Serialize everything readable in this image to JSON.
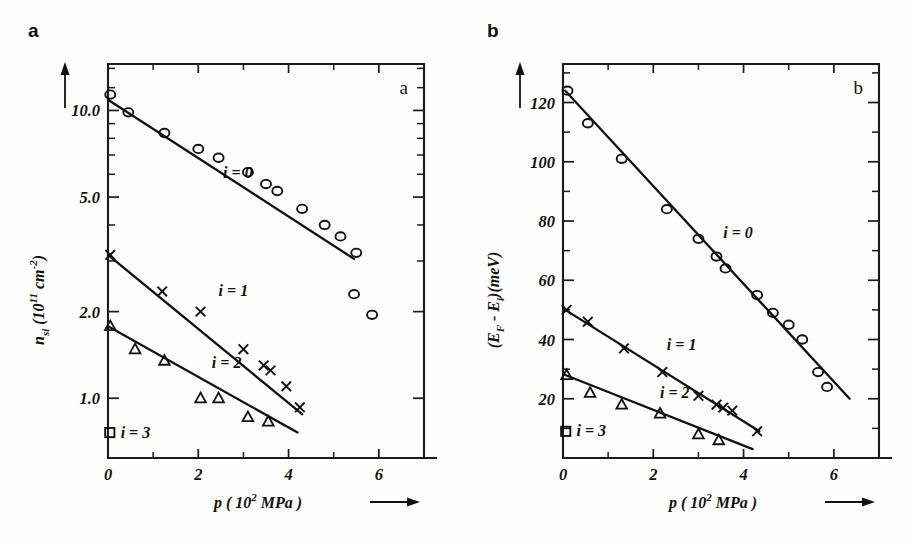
{
  "figure": {
    "panel_a_letter": "a",
    "panel_b_letter": "b"
  },
  "chart_data": [
    {
      "id": "panel-a",
      "type": "scatter",
      "corner_label": "a",
      "title": "",
      "xlabel": "p (10^2 MPa)",
      "xlabel_parts": {
        "symbol": "p",
        "open": "(",
        "base": "10",
        "exp": "2",
        "unit": "MPa",
        "close": ")"
      },
      "ylabel": "n_si (10^11 cm^-2)",
      "ylabel_parts": {
        "symbol": "n",
        "sub": "si",
        "open": "(",
        "base": "10",
        "exp": "11",
        "unit": "cm",
        "unitexp": "-2",
        "close": ")"
      },
      "xscale": "linear",
      "yscale": "log",
      "xlim": [
        0,
        7
      ],
      "ylim": [
        0.62,
        14.5
      ],
      "xticks": [
        0,
        2,
        4,
        6
      ],
      "xticklabels": [
        "0",
        "2",
        "4",
        "6"
      ],
      "xminorticks": [
        1,
        3,
        5,
        7
      ],
      "yticks": [
        1.0,
        2.0,
        5.0,
        10.0
      ],
      "yticklabels": [
        "1.0",
        "2.0",
        "5.0",
        "10.0"
      ],
      "yminorticks": [
        3.0,
        4.0,
        6.0,
        7.0,
        8.0,
        9.0,
        12.0,
        14.0
      ],
      "grid": false,
      "legend_position": "inline-annotations",
      "series": [
        {
          "name": "i = 0",
          "label": "i = 0",
          "marker": "circle",
          "label_x": 2.55,
          "label_y": 6.05,
          "fit": {
            "x": [
              0.0,
              5.45
            ],
            "y": [
              10.9,
              3.05
            ]
          },
          "points": [
            {
              "x": 0.05,
              "y": 11.35
            },
            {
              "x": 0.45,
              "y": 9.85
            },
            {
              "x": 1.25,
              "y": 8.35
            },
            {
              "x": 2.0,
              "y": 7.35
            },
            {
              "x": 2.45,
              "y": 6.85
            },
            {
              "x": 3.1,
              "y": 6.1
            },
            {
              "x": 3.5,
              "y": 5.55
            },
            {
              "x": 3.75,
              "y": 5.25
            },
            {
              "x": 4.3,
              "y": 4.55
            },
            {
              "x": 4.8,
              "y": 4.0
            },
            {
              "x": 5.15,
              "y": 3.65
            },
            {
              "x": 5.5,
              "y": 3.2
            },
            {
              "x": 5.45,
              "y": 2.3
            },
            {
              "x": 5.85,
              "y": 1.95
            }
          ]
        },
        {
          "name": "i = 1",
          "label": "i = 1",
          "marker": "cross",
          "label_x": 2.45,
          "label_y": 2.35,
          "fit": {
            "x": [
              0.0,
              4.3
            ],
            "y": [
              3.15,
              0.88
            ]
          },
          "points": [
            {
              "x": 0.05,
              "y": 3.15
            },
            {
              "x": 1.2,
              "y": 2.35
            },
            {
              "x": 2.05,
              "y": 2.0
            },
            {
              "x": 3.0,
              "y": 1.48
            },
            {
              "x": 3.45,
              "y": 1.3
            },
            {
              "x": 3.6,
              "y": 1.25
            },
            {
              "x": 3.95,
              "y": 1.1
            },
            {
              "x": 4.25,
              "y": 0.93
            }
          ]
        },
        {
          "name": "i = 2",
          "label": "i = 2",
          "marker": "triangle",
          "label_x": 2.3,
          "label_y": 1.33,
          "fit": {
            "x": [
              0.0,
              4.2
            ],
            "y": [
              1.78,
              0.76
            ]
          },
          "points": [
            {
              "x": 0.05,
              "y": 1.78
            },
            {
              "x": 0.6,
              "y": 1.48
            },
            {
              "x": 1.25,
              "y": 1.35
            },
            {
              "x": 2.05,
              "y": 1.0
            },
            {
              "x": 2.45,
              "y": 1.0
            },
            {
              "x": 3.1,
              "y": 0.86
            },
            {
              "x": 3.55,
              "y": 0.83
            }
          ]
        },
        {
          "name": "i = 3",
          "label": "i = 3",
          "marker": "square",
          "label_x": 0.28,
          "label_y": 0.755,
          "fit": null,
          "points": [
            {
              "x": 0.04,
              "y": 0.76
            }
          ]
        }
      ]
    },
    {
      "id": "panel-b",
      "type": "scatter",
      "corner_label": "b",
      "title": "",
      "xlabel": "p (10^2 MPa)",
      "xlabel_parts": {
        "symbol": "p",
        "open": "(",
        "base": "10",
        "exp": "2",
        "unit": "MPa",
        "close": ")"
      },
      "ylabel": "(E_F - E_i)(meV)",
      "ylabel_parts": {
        "open": "(",
        "e1": "E",
        "sub1": "F",
        "minus": "-",
        "e2": "E",
        "sub2": "i",
        "close": ")(meV)"
      },
      "xscale": "linear",
      "yscale": "linear",
      "xlim": [
        0,
        7
      ],
      "ylim": [
        0,
        133
      ],
      "xticks": [
        0,
        2,
        4,
        6
      ],
      "xticklabels": [
        "0",
        "2",
        "4",
        "6"
      ],
      "xminorticks": [
        1,
        3,
        5,
        7
      ],
      "yticks": [
        20,
        40,
        60,
        80,
        100,
        120
      ],
      "yticklabels": [
        "20",
        "40",
        "60",
        "80",
        "100",
        "120"
      ],
      "yminorticks": [
        10,
        30,
        50,
        70,
        90,
        110,
        130
      ],
      "grid": false,
      "legend_position": "inline-annotations",
      "series": [
        {
          "name": "i = 0",
          "label": "i = 0",
          "marker": "circle",
          "label_x": 3.55,
          "label_y": 76,
          "fit": {
            "x": [
              0.05,
              6.35
            ],
            "y": [
              124,
              20
            ]
          },
          "points": [
            {
              "x": 0.1,
              "y": 124
            },
            {
              "x": 0.55,
              "y": 113
            },
            {
              "x": 1.3,
              "y": 101
            },
            {
              "x": 2.3,
              "y": 84
            },
            {
              "x": 3.0,
              "y": 74
            },
            {
              "x": 3.4,
              "y": 68
            },
            {
              "x": 3.6,
              "y": 64
            },
            {
              "x": 4.3,
              "y": 55
            },
            {
              "x": 4.65,
              "y": 49
            },
            {
              "x": 5.0,
              "y": 45
            },
            {
              "x": 5.3,
              "y": 40
            },
            {
              "x": 5.65,
              "y": 29
            },
            {
              "x": 5.85,
              "y": 24
            }
          ]
        },
        {
          "name": "i = 1",
          "label": "i = 1",
          "marker": "cross",
          "label_x": 2.3,
          "label_y": 38,
          "fit": {
            "x": [
              0.05,
              4.35
            ],
            "y": [
              50,
              9
            ]
          },
          "points": [
            {
              "x": 0.08,
              "y": 50
            },
            {
              "x": 0.55,
              "y": 46
            },
            {
              "x": 1.35,
              "y": 37
            },
            {
              "x": 2.2,
              "y": 29
            },
            {
              "x": 3.0,
              "y": 21
            },
            {
              "x": 3.4,
              "y": 18
            },
            {
              "x": 3.55,
              "y": 17
            },
            {
              "x": 3.75,
              "y": 16
            },
            {
              "x": 4.3,
              "y": 9
            }
          ]
        },
        {
          "name": "i = 2",
          "label": "i = 2",
          "marker": "triangle",
          "label_x": 2.15,
          "label_y": 22,
          "fit": {
            "x": [
              0.05,
              4.2
            ],
            "y": [
              28,
              3
            ]
          },
          "points": [
            {
              "x": 0.08,
              "y": 28
            },
            {
              "x": 0.6,
              "y": 22
            },
            {
              "x": 1.3,
              "y": 18
            },
            {
              "x": 2.15,
              "y": 15
            },
            {
              "x": 3.0,
              "y": 8
            },
            {
              "x": 3.45,
              "y": 6
            }
          ]
        },
        {
          "name": "i = 3",
          "label": "i = 3",
          "marker": "square",
          "label_x": 0.3,
          "label_y": 9,
          "fit": null,
          "points": [
            {
              "x": 0.06,
              "y": 9
            }
          ]
        }
      ]
    }
  ]
}
